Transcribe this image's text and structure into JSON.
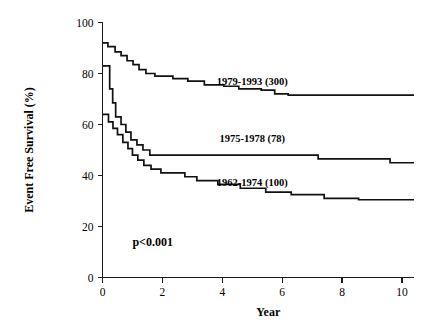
{
  "chart_data": {
    "type": "line",
    "subtype": "kaplan-meier-step",
    "title": "",
    "xlabel": "Year",
    "ylabel": "Event Free Survival (%)",
    "xlim": [
      0,
      10.4
    ],
    "ylim": [
      0,
      100
    ],
    "xticks": [
      0,
      2,
      4,
      6,
      8,
      10
    ],
    "xtick_labels": [
      "0",
      "2",
      "4",
      "6",
      "8",
      "10"
    ],
    "yticks": [
      0,
      20,
      40,
      60,
      80,
      100
    ],
    "ytick_labels": [
      "0",
      "20",
      "40",
      "60",
      "80",
      "100"
    ],
    "grid": false,
    "legend_position": "inline-right-of-curves",
    "annotations": [
      {
        "name": "p-value",
        "text": "p<0.001",
        "x": 1.0,
        "y": 12.5
      }
    ],
    "series": [
      {
        "name": "1979-1993 (300)",
        "label": "1979-1993 (300)",
        "n": 300,
        "period": "1979-1993",
        "color": "#111111",
        "label_x": 5.0,
        "label_y": 75.5,
        "points": [
          [
            0.0,
            92.0
          ],
          [
            0.18,
            92.0
          ],
          [
            0.18,
            90.5
          ],
          [
            0.42,
            90.5
          ],
          [
            0.42,
            88.5
          ],
          [
            0.62,
            88.5
          ],
          [
            0.62,
            87.0
          ],
          [
            0.82,
            87.0
          ],
          [
            0.82,
            85.0
          ],
          [
            1.02,
            85.0
          ],
          [
            1.02,
            83.5
          ],
          [
            1.22,
            83.5
          ],
          [
            1.22,
            81.5
          ],
          [
            1.45,
            81.5
          ],
          [
            1.45,
            80.0
          ],
          [
            1.75,
            80.0
          ],
          [
            1.75,
            79.0
          ],
          [
            2.35,
            79.0
          ],
          [
            2.35,
            78.0
          ],
          [
            2.85,
            78.0
          ],
          [
            2.85,
            77.0
          ],
          [
            3.4,
            77.0
          ],
          [
            3.4,
            75.5
          ],
          [
            4.05,
            75.5
          ],
          [
            4.05,
            75.0
          ],
          [
            4.55,
            75.0
          ],
          [
            4.55,
            74.0
          ],
          [
            5.3,
            74.0
          ],
          [
            5.3,
            73.5
          ],
          [
            5.75,
            73.5
          ],
          [
            5.75,
            72.0
          ],
          [
            6.2,
            72.0
          ],
          [
            6.2,
            71.5
          ],
          [
            10.4,
            71.5
          ]
        ]
      },
      {
        "name": "1975-1978 (78)",
        "label": "1975-1978 (78)",
        "n": 78,
        "period": "1975-1978",
        "color": "#111111",
        "label_x": 5.0,
        "label_y": 53.0,
        "points": [
          [
            0.0,
            83.0
          ],
          [
            0.24,
            83.0
          ],
          [
            0.24,
            74.0
          ],
          [
            0.34,
            74.0
          ],
          [
            0.34,
            68.5
          ],
          [
            0.44,
            68.5
          ],
          [
            0.44,
            63.0
          ],
          [
            0.62,
            63.0
          ],
          [
            0.62,
            60.0
          ],
          [
            0.78,
            60.0
          ],
          [
            0.78,
            57.0
          ],
          [
            0.95,
            57.0
          ],
          [
            0.95,
            54.0
          ],
          [
            1.15,
            54.0
          ],
          [
            1.15,
            52.0
          ],
          [
            1.35,
            52.0
          ],
          [
            1.35,
            50.0
          ],
          [
            1.58,
            50.0
          ],
          [
            1.58,
            48.0
          ],
          [
            7.2,
            48.0
          ],
          [
            7.2,
            46.5
          ],
          [
            9.6,
            46.5
          ],
          [
            9.6,
            45.0
          ],
          [
            10.4,
            45.0
          ]
        ]
      },
      {
        "name": "1962-1974 (100)",
        "label": "1962-1974 (100)",
        "n": 100,
        "period": "1962-1974",
        "color": "#111111",
        "label_x": 5.0,
        "label_y": 36.0,
        "points": [
          [
            0.0,
            64.0
          ],
          [
            0.2,
            64.0
          ],
          [
            0.2,
            61.0
          ],
          [
            0.35,
            61.0
          ],
          [
            0.35,
            58.5
          ],
          [
            0.5,
            58.5
          ],
          [
            0.5,
            56.0
          ],
          [
            0.68,
            56.0
          ],
          [
            0.68,
            53.0
          ],
          [
            0.85,
            53.0
          ],
          [
            0.85,
            50.5
          ],
          [
            1.0,
            50.5
          ],
          [
            1.0,
            48.0
          ],
          [
            1.18,
            48.0
          ],
          [
            1.18,
            46.0
          ],
          [
            1.38,
            46.0
          ],
          [
            1.38,
            44.0
          ],
          [
            1.62,
            44.0
          ],
          [
            1.62,
            42.5
          ],
          [
            1.95,
            42.5
          ],
          [
            1.95,
            41.0
          ],
          [
            2.75,
            41.0
          ],
          [
            2.75,
            39.5
          ],
          [
            3.15,
            39.5
          ],
          [
            3.15,
            38.0
          ],
          [
            3.85,
            38.0
          ],
          [
            3.85,
            36.5
          ],
          [
            4.6,
            36.5
          ],
          [
            4.6,
            35.0
          ],
          [
            5.45,
            35.0
          ],
          [
            5.45,
            33.5
          ],
          [
            6.3,
            33.5
          ],
          [
            6.3,
            32.5
          ],
          [
            7.4,
            32.5
          ],
          [
            7.4,
            31.0
          ],
          [
            8.55,
            31.0
          ],
          [
            8.55,
            30.5
          ],
          [
            10.4,
            30.5
          ]
        ]
      }
    ]
  },
  "axes": {
    "x_title": "Year",
    "y_title": "Event Free Survival (%)"
  }
}
